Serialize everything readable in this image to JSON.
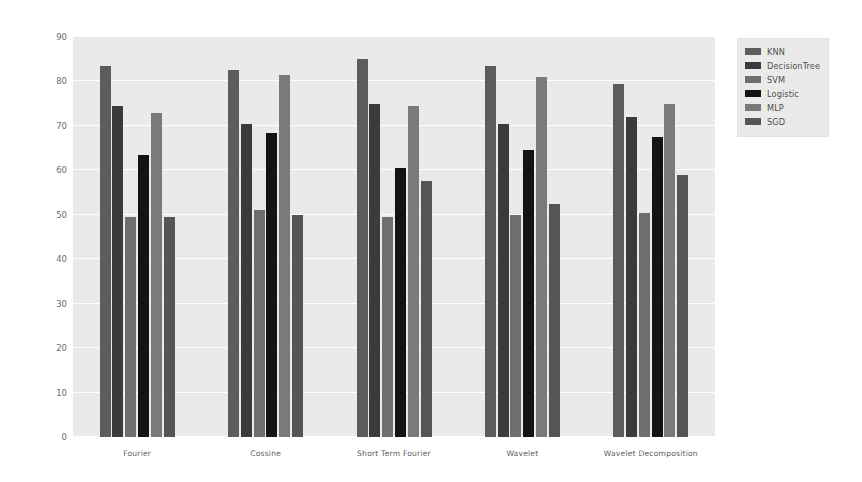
{
  "chart_data": {
    "type": "bar",
    "title": "",
    "xlabel": "",
    "ylabel": "Precision",
    "ylim": [
      0,
      90
    ],
    "yticks": [
      0,
      10,
      20,
      30,
      40,
      50,
      60,
      70,
      80,
      90
    ],
    "grid": true,
    "legend_position": "upper right outside",
    "categories": [
      "Fourier",
      "Cossine",
      "Short Term Fourier",
      "Wavelet",
      "Wavelet Decomposition"
    ],
    "series": [
      {
        "name": "KNN",
        "color": "#5c5c5c",
        "values": [
          83.5,
          82.5,
          85.0,
          83.5,
          79.5
        ]
      },
      {
        "name": "DecisionTree",
        "color": "#3b3b3b",
        "values": [
          74.5,
          70.5,
          75.0,
          70.5,
          72.0
        ]
      },
      {
        "name": "SVM",
        "color": "#6e6e6e",
        "values": [
          49.5,
          51.0,
          49.5,
          50.0,
          50.5
        ]
      },
      {
        "name": "Logistic",
        "color": "#141414",
        "values": [
          63.5,
          68.5,
          60.5,
          64.5,
          67.5
        ]
      },
      {
        "name": "MLP",
        "color": "#7a7a7a",
        "values": [
          73.0,
          81.5,
          74.5,
          81.0,
          75.0
        ]
      },
      {
        "name": "SGD",
        "color": "#555555",
        "values": [
          49.5,
          50.0,
          57.5,
          52.5,
          59.0
        ]
      }
    ]
  },
  "legend": {
    "items": [
      {
        "label": "KNN",
        "color": "#5c5c5c"
      },
      {
        "label": "DecisionTree",
        "color": "#3b3b3b"
      },
      {
        "label": "SVM",
        "color": "#6e6e6e"
      },
      {
        "label": "Logistic",
        "color": "#141414"
      },
      {
        "label": "MLP",
        "color": "#7a7a7a"
      },
      {
        "label": "SGD",
        "color": "#555555"
      }
    ]
  },
  "axes": {
    "y_label": "Precision",
    "y_tick_labels": [
      "90",
      "80",
      "70",
      "60",
      "50",
      "40",
      "30",
      "20",
      "10",
      "0"
    ],
    "x_tick_labels": [
      "Fourier",
      "Cossine",
      "Short Term Fourier",
      "Wavelet",
      "Wavelet Decomposition"
    ]
  },
  "style": {
    "plot_background": "#eaeaea",
    "figure_background": "#ffffff",
    "gridline_color": "#ffffff"
  }
}
